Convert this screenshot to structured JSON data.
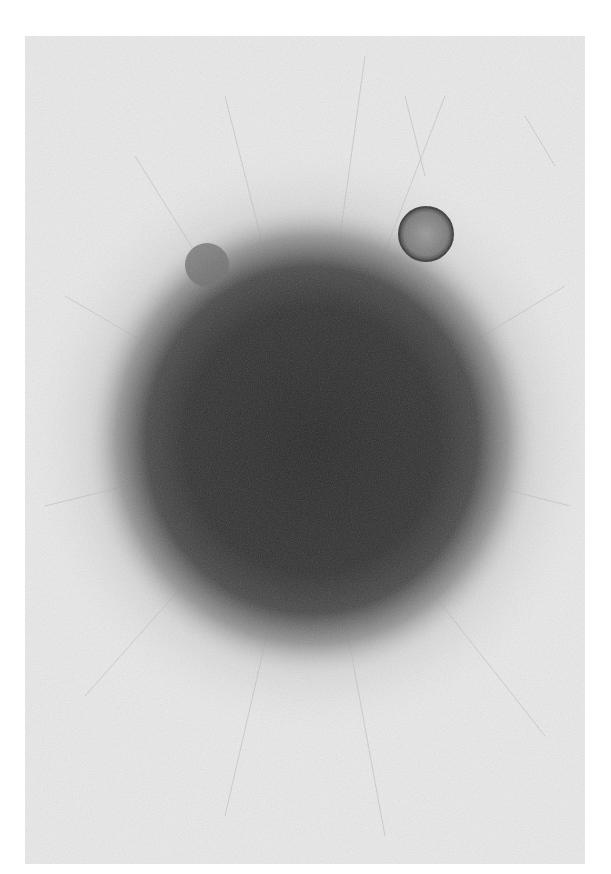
{
  "image": {
    "kind": "grayscale micrograph",
    "subject": "dense spherical cell aggregate (spheroid) with radiating fibrous outgrowth",
    "background_color": "#ffffff",
    "panel_color": "#e9e9e9",
    "core_color": "#2e2e2e",
    "halo_color": "#6a6a6a",
    "panel": {
      "x": 25,
      "y": 36,
      "width": 560,
      "height": 828
    },
    "main_body": {
      "cx": 312,
      "cy": 440,
      "rx": 215,
      "ry": 225
    },
    "small_sphere": {
      "cx": 426,
      "cy": 234,
      "r": 27
    },
    "small_bulge": {
      "cx": 207,
      "cy": 265,
      "r": 22
    }
  }
}
